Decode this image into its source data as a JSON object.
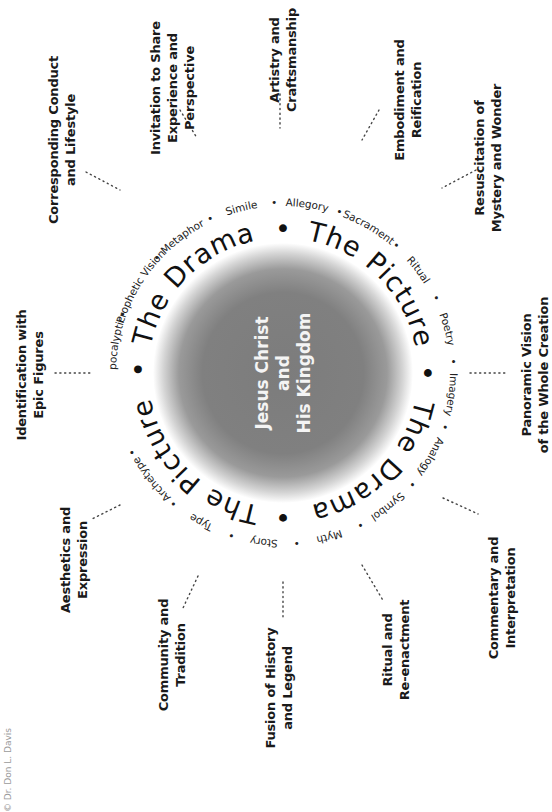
{
  "center": {
    "lines": [
      "Jesus Christ",
      "and",
      "His Kingdom"
    ],
    "disk_color": "#7a7a7a",
    "text_color": "#f4f4f4"
  },
  "inner_ring": {
    "phrases": [
      "The Drama",
      "The Picture",
      "The Drama",
      "The Picture"
    ],
    "separator": "•"
  },
  "outer_ring": {
    "items": [
      "Apocalyptic",
      "Prophetic Vision",
      "Metaphor",
      "Simile",
      "Allegory",
      "Sacrament",
      "Ritual",
      "Poetry",
      "Imagery",
      "Analogy",
      "Symbol",
      "Myth",
      "Story",
      "Type",
      "Archetype"
    ],
    "separator": "•"
  },
  "labels": [
    {
      "id": "identification",
      "lines": [
        "Identification with",
        "Epic Figures"
      ]
    },
    {
      "id": "corresponding",
      "lines": [
        "Corresponding Conduct",
        "and Lifestyle"
      ]
    },
    {
      "id": "invitation",
      "lines": [
        "Invitation to Share",
        "Experience and",
        "Perspective"
      ]
    },
    {
      "id": "artistry",
      "lines": [
        "Artistry and",
        "Craftsmanship"
      ]
    },
    {
      "id": "embodiment",
      "lines": [
        "Embodiment and",
        "Reification"
      ]
    },
    {
      "id": "resuscitation",
      "lines": [
        "Resuscitation of",
        "Mystery and Wonder"
      ]
    },
    {
      "id": "panoramic",
      "lines": [
        "Panoramic Vision",
        "of the Whole Creation"
      ]
    },
    {
      "id": "commentary",
      "lines": [
        "Commentary and",
        "Interpretation"
      ]
    },
    {
      "id": "ritual",
      "lines": [
        "Ritual and",
        "Re-enactment"
      ]
    },
    {
      "id": "fusion",
      "lines": [
        "Fusion of History",
        "and Legend"
      ]
    },
    {
      "id": "community",
      "lines": [
        "Community and",
        "Tradition"
      ]
    },
    {
      "id": "aesthetics",
      "lines": [
        "Aesthetics and",
        "Expression"
      ]
    }
  ],
  "copyright": "© Dr. Don L. Davis"
}
